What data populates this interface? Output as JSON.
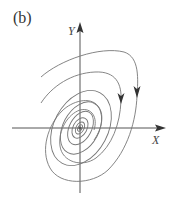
{
  "figure": {
    "panel_label": "(b)",
    "x_axis_label": "X",
    "y_axis_label": "Y",
    "type": "phase-portrait",
    "colors": {
      "axes": "#555555",
      "trajectories": "#777777",
      "arrowheads": "#333333",
      "text": "#333333"
    }
  }
}
